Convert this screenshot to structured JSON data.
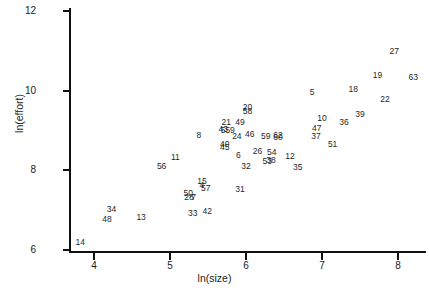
{
  "chart_data": {
    "type": "scatter",
    "title": "",
    "xlabel": "ln(size)",
    "ylabel": "ln(effort)",
    "xlim": [
      3.67,
      8.3
    ],
    "ylim": [
      5.97,
      12.06
    ],
    "xticks": [
      4,
      5,
      6,
      7,
      8
    ],
    "xticklabels": [
      "4",
      "5",
      "6",
      "7",
      "8"
    ],
    "yticks": [
      6,
      8,
      10,
      12
    ],
    "yticklabels": [
      "6",
      "8",
      "10",
      "12"
    ],
    "grid": false,
    "legend": null,
    "marker_style": "text-label",
    "note": "Each data point is drawn as its numeric project id label rather than a marker glyph.",
    "points": [
      {
        "label": "14",
        "x": 3.82,
        "y": 6.2
      },
      {
        "label": "48",
        "x": 4.17,
        "y": 6.78
      },
      {
        "label": "34",
        "x": 4.23,
        "y": 7.03
      },
      {
        "label": "13",
        "x": 4.62,
        "y": 6.83
      },
      {
        "label": "56",
        "x": 4.89,
        "y": 8.1
      },
      {
        "label": "11",
        "x": 5.07,
        "y": 8.33
      },
      {
        "label": "50",
        "x": 5.24,
        "y": 7.43
      },
      {
        "label": "28",
        "x": 5.25,
        "y": 7.32
      },
      {
        "label": "7",
        "x": 5.31,
        "y": 7.33
      },
      {
        "label": "33",
        "x": 5.3,
        "y": 6.93
      },
      {
        "label": "15",
        "x": 5.42,
        "y": 7.72
      },
      {
        "label": "4",
        "x": 5.42,
        "y": 7.63
      },
      {
        "label": "57",
        "x": 5.47,
        "y": 7.55
      },
      {
        "label": "42",
        "x": 5.49,
        "y": 6.99
      },
      {
        "label": "8",
        "x": 5.38,
        "y": 8.88
      },
      {
        "label": "21",
        "x": 5.74,
        "y": 9.2
      },
      {
        "label": "43",
        "x": 5.7,
        "y": 9.03
      },
      {
        "label": "55",
        "x": 5.73,
        "y": 9.01
      },
      {
        "label": "9",
        "x": 5.82,
        "y": 9.02
      },
      {
        "label": "49",
        "x": 5.92,
        "y": 9.22
      },
      {
        "label": "20",
        "x": 6.02,
        "y": 9.6
      },
      {
        "label": "58",
        "x": 6.02,
        "y": 9.49
      },
      {
        "label": "24",
        "x": 5.88,
        "y": 8.87
      },
      {
        "label": "40",
        "x": 5.72,
        "y": 8.67
      },
      {
        "label": "45",
        "x": 5.72,
        "y": 8.59
      },
      {
        "label": "46",
        "x": 6.05,
        "y": 8.91
      },
      {
        "label": "6",
        "x": 5.9,
        "y": 8.39
      },
      {
        "label": "26",
        "x": 6.15,
        "y": 8.48
      },
      {
        "label": "32",
        "x": 6.0,
        "y": 8.12
      },
      {
        "label": "31",
        "x": 5.92,
        "y": 7.53
      },
      {
        "label": "59",
        "x": 6.26,
        "y": 8.86
      },
      {
        "label": "62",
        "x": 6.42,
        "y": 8.89
      },
      {
        "label": "60",
        "x": 6.42,
        "y": 8.84
      },
      {
        "label": "54",
        "x": 6.34,
        "y": 8.45
      },
      {
        "label": "53",
        "x": 6.28,
        "y": 8.23
      },
      {
        "label": "38",
        "x": 6.33,
        "y": 8.25
      },
      {
        "label": "12",
        "x": 6.58,
        "y": 8.37
      },
      {
        "label": "35",
        "x": 6.68,
        "y": 8.09
      },
      {
        "label": "5",
        "x": 6.87,
        "y": 9.97
      },
      {
        "label": "10",
        "x": 7.0,
        "y": 9.31
      },
      {
        "label": "47",
        "x": 6.93,
        "y": 9.05
      },
      {
        "label": "37",
        "x": 6.92,
        "y": 8.87
      },
      {
        "label": "51",
        "x": 7.14,
        "y": 8.66
      },
      {
        "label": "36",
        "x": 7.29,
        "y": 9.21
      },
      {
        "label": "39",
        "x": 7.5,
        "y": 9.42
      },
      {
        "label": "18",
        "x": 7.41,
        "y": 10.05
      },
      {
        "label": "19",
        "x": 7.73,
        "y": 10.38
      },
      {
        "label": "22",
        "x": 7.83,
        "y": 9.8
      },
      {
        "label": "27",
        "x": 7.95,
        "y": 11.0
      },
      {
        "label": "63",
        "x": 8.2,
        "y": 10.35
      }
    ]
  }
}
